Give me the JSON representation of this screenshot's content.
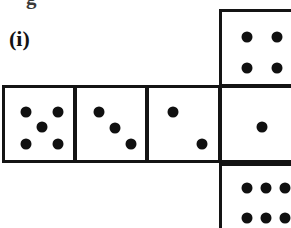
{
  "figure": {
    "label": "(i)",
    "clipped_text_above": "g",
    "colors": {
      "ink": "#101010",
      "border": "#141414",
      "background": "#ffffff"
    }
  },
  "net": {
    "pip_radius_px": 5.5,
    "faces": [
      {
        "id": "face-top-right",
        "name": "four-face",
        "value": 4,
        "position": "top-right",
        "box": {
          "x": 219,
          "y": 9,
          "w": 78,
          "h": 78
        },
        "pips": [
          {
            "cx": 25,
            "cy": 25
          },
          {
            "cx": 55,
            "cy": 25
          },
          {
            "cx": 25,
            "cy": 56
          },
          {
            "cx": 55,
            "cy": 56
          }
        ]
      },
      {
        "id": "face-mid-1",
        "name": "five-face",
        "value": 5,
        "position": "middle-row-1",
        "box": {
          "x": 2,
          "y": 85,
          "w": 74,
          "h": 78
        },
        "pips": [
          {
            "cx": 21,
            "cy": 24
          },
          {
            "cx": 53,
            "cy": 24
          },
          {
            "cx": 37,
            "cy": 39
          },
          {
            "cx": 21,
            "cy": 56
          },
          {
            "cx": 53,
            "cy": 56
          }
        ]
      },
      {
        "id": "face-mid-2",
        "name": "three-face",
        "value": 3,
        "position": "middle-row-2",
        "box": {
          "x": 74,
          "y": 85,
          "w": 74,
          "h": 78
        },
        "pips": [
          {
            "cx": 22,
            "cy": 24
          },
          {
            "cx": 38,
            "cy": 40
          },
          {
            "cx": 54,
            "cy": 56
          }
        ]
      },
      {
        "id": "face-mid-3",
        "name": "two-face",
        "value": 2,
        "position": "middle-row-3",
        "box": {
          "x": 146,
          "y": 85,
          "w": 75,
          "h": 78
        },
        "pips": [
          {
            "cx": 24,
            "cy": 24
          },
          {
            "cx": 53,
            "cy": 56
          }
        ]
      },
      {
        "id": "face-mid-4",
        "name": "one-face",
        "value": 1,
        "position": "middle-row-4",
        "box": {
          "x": 219,
          "y": 85,
          "w": 78,
          "h": 78
        },
        "pips": [
          {
            "cx": 40,
            "cy": 39
          }
        ]
      },
      {
        "id": "face-bottom-right",
        "name": "six-face",
        "value": 6,
        "position": "bottom-right",
        "box": {
          "x": 219,
          "y": 163,
          "w": 78,
          "h": 78
        },
        "pips": [
          {
            "cx": 25,
            "cy": 22
          },
          {
            "cx": 44,
            "cy": 22
          },
          {
            "cx": 63,
            "cy": 22
          },
          {
            "cx": 25,
            "cy": 52
          },
          {
            "cx": 44,
            "cy": 52
          },
          {
            "cx": 63,
            "cy": 52
          }
        ]
      }
    ]
  }
}
